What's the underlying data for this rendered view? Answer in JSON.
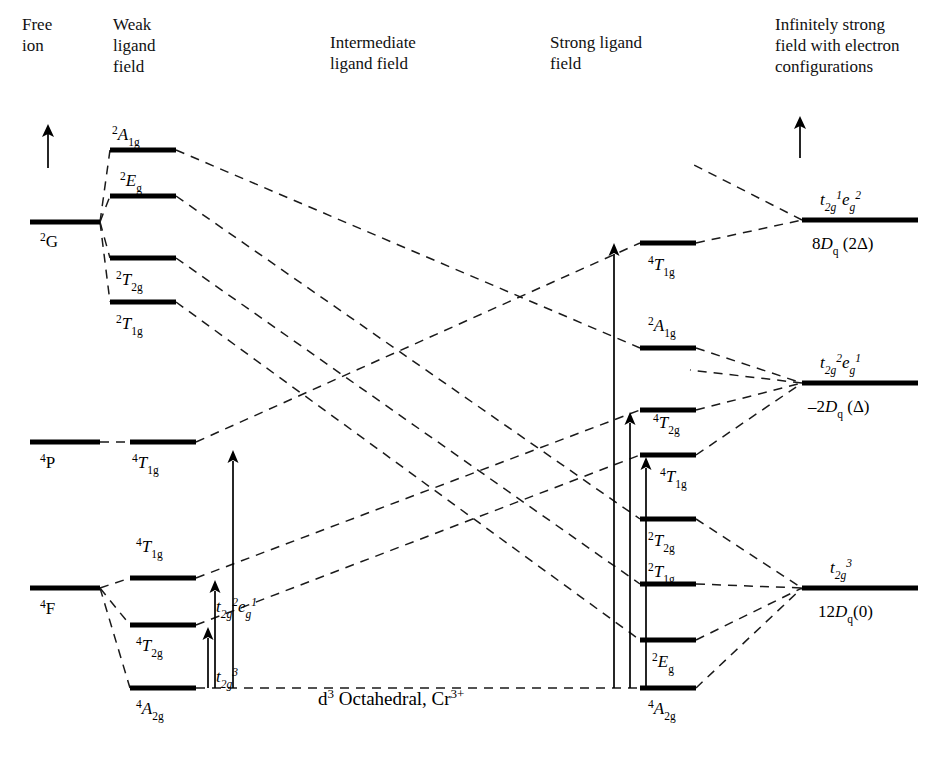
{
  "figure": {
    "caption": "d3 Octahedral, Cr3+",
    "caption_parts": {
      "d": "d",
      "d_sup": "3",
      "text": " Octahedral, Cr",
      "cr_sup": "3+"
    }
  },
  "columns": [
    {
      "id": "free-ion",
      "heading": "Free\nion",
      "heading_lines": [
        "Free",
        "ion"
      ]
    },
    {
      "id": "weak-field",
      "heading": "Weak ligand field",
      "heading_lines": [
        "Weak",
        "ligand",
        "field"
      ]
    },
    {
      "id": "intermediate-field",
      "heading": "Intermediate ligand field",
      "heading_lines": [
        "Intermediate",
        "ligand field"
      ]
    },
    {
      "id": "strong-field",
      "heading": "Strong ligand field",
      "heading_lines": [
        "Strong ligand",
        "field"
      ]
    },
    {
      "id": "infinite-field",
      "heading": "Infinitely strong field with electron configurations",
      "heading_lines": [
        "Infinitely strong",
        "field with electron",
        "configurations"
      ]
    }
  ],
  "axis": {
    "label": "energy-increasing-arrow",
    "direction": "up"
  },
  "free_ion_levels": [
    {
      "name": "2G",
      "sup": "2",
      "term": "G",
      "sub": "",
      "x1": 30,
      "x2": 100,
      "y": 222,
      "label_x": 40,
      "label_y": 247
    },
    {
      "name": "4P",
      "sup": "4",
      "term": "P",
      "sub": "",
      "x1": 30,
      "x2": 100,
      "y": 442,
      "label_x": 40,
      "label_y": 468
    },
    {
      "name": "4F",
      "sup": "4",
      "term": "F",
      "sub": "",
      "x1": 30,
      "x2": 100,
      "y": 588,
      "label_x": 40,
      "label_y": 614
    }
  ],
  "weak_field_levels": [
    {
      "name": "2A1g",
      "sup": "2",
      "term": "A",
      "sub": "1g",
      "x1": 110,
      "x2": 176,
      "y": 150,
      "label_x": 112,
      "label_y": 140,
      "label_above": true
    },
    {
      "name": "2Eg",
      "sup": "2",
      "term": "E",
      "sub": "g",
      "x1": 110,
      "x2": 176,
      "y": 196,
      "label_x": 120,
      "label_y": 186,
      "label_above": true
    },
    {
      "name": "2T2g",
      "sup": "2",
      "term": "T",
      "sub": "2g",
      "x1": 110,
      "x2": 176,
      "y": 258,
      "label_x": 116,
      "label_y": 285,
      "label_above": false
    },
    {
      "name": "2T1g",
      "sup": "2",
      "term": "T",
      "sub": "1g",
      "x1": 110,
      "x2": 176,
      "y": 302,
      "label_x": 116,
      "label_y": 329,
      "label_above": false
    },
    {
      "name": "4T1g-P",
      "sup": "4",
      "term": "T",
      "sub": "1g",
      "x1": 130,
      "x2": 196,
      "y": 442,
      "label_x": 132,
      "label_y": 468,
      "label_above": false
    },
    {
      "name": "4T1g-F",
      "sup": "4",
      "term": "T",
      "sub": "1g",
      "x1": 130,
      "x2": 196,
      "y": 578,
      "label_x": 136,
      "label_y": 552,
      "label_above": true
    },
    {
      "name": "4T2g",
      "sup": "4",
      "term": "T",
      "sub": "2g",
      "x1": 130,
      "x2": 196,
      "y": 625,
      "label_x": 136,
      "label_y": 651,
      "label_above": false
    },
    {
      "name": "4A2g",
      "sup": "4",
      "term": "A",
      "sub": "2g",
      "x1": 130,
      "x2": 196,
      "y": 688,
      "label_x": 136,
      "label_y": 714,
      "label_above": false
    }
  ],
  "weak_field_configs": [
    {
      "name": "t2g2eg1",
      "x": 216,
      "y": 612,
      "parts": [
        {
          "t": "t",
          "i": true
        },
        {
          "t": "2g",
          "sub": true
        },
        {
          "t": "2",
          "sup": true
        },
        {
          "t": "e",
          "i": true
        },
        {
          "t": "g",
          "sub": true
        },
        {
          "t": "1",
          "sup": true
        }
      ]
    },
    {
      "name": "t2g3",
      "x": 216,
      "y": 682,
      "parts": [
        {
          "t": "t",
          "i": true
        },
        {
          "t": "2g",
          "sub": true
        },
        {
          "t": "3",
          "sup": true
        }
      ]
    }
  ],
  "strong_field_levels": [
    {
      "name": "4T1g-top",
      "sup": "4",
      "term": "T",
      "sub": "1g",
      "x1": 640,
      "x2": 696,
      "y": 243,
      "label_x": 648,
      "label_y": 270,
      "label_above": false
    },
    {
      "name": "2A1g",
      "sup": "2",
      "term": "A",
      "sub": "1g",
      "x1": 640,
      "x2": 696,
      "y": 348,
      "label_x": 648,
      "label_y": 331,
      "label_above": true
    },
    {
      "name": "4T2g",
      "sup": "4",
      "term": "T",
      "sub": "2g",
      "x1": 640,
      "x2": 696,
      "y": 410,
      "label_x": 653,
      "label_y": 428,
      "label_above": false
    },
    {
      "name": "4T1g-mid",
      "sup": "4",
      "term": "T",
      "sub": "1g",
      "x1": 640,
      "x2": 696,
      "y": 455,
      "label_x": 660,
      "label_y": 482,
      "label_above": false
    },
    {
      "name": "2T2g",
      "sup": "2",
      "term": "T",
      "sub": "2g",
      "x1": 640,
      "x2": 696,
      "y": 519,
      "label_x": 648,
      "label_y": 546,
      "label_above": false
    },
    {
      "name": "2T1g",
      "sup": "2",
      "term": "T",
      "sub": "1g",
      "x1": 640,
      "x2": 696,
      "y": 584,
      "label_x": 648,
      "label_y": 577,
      "label_above": true
    },
    {
      "name": "2Eg",
      "sup": "2",
      "term": "E",
      "sub": "g",
      "x1": 640,
      "x2": 696,
      "y": 640,
      "label_x": 652,
      "label_y": 667,
      "label_above": false
    },
    {
      "name": "4A2g",
      "sup": "4",
      "term": "A",
      "sub": "2g",
      "x1": 640,
      "x2": 696,
      "y": 688,
      "label_x": 648,
      "label_y": 714,
      "label_above": false
    }
  ],
  "infinite_field_levels": [
    {
      "name": "t2g1eg2",
      "x1": 802,
      "x2": 918,
      "y": 220,
      "config_x": 820,
      "config_y": 205,
      "config_parts": [
        {
          "t": "t",
          "i": true
        },
        {
          "t": "2g",
          "sub": true
        },
        {
          "t": "1",
          "sup": true
        },
        {
          "t": "e",
          "i": true
        },
        {
          "t": "g",
          "sub": true
        },
        {
          "t": "2",
          "sup": true
        }
      ],
      "energy": "8Dq (2Δ)",
      "energy_x": 812,
      "energy_y": 249,
      "energy_parts": [
        {
          "t": "8"
        },
        {
          "t": "D",
          "i": true
        },
        {
          "t": "q",
          "sub": true
        },
        {
          "t": " (2Δ)"
        }
      ]
    },
    {
      "name": "t2g2eg1",
      "x1": 802,
      "x2": 918,
      "y": 383,
      "config_x": 820,
      "config_y": 368,
      "config_parts": [
        {
          "t": "t",
          "i": true
        },
        {
          "t": "2g",
          "sub": true
        },
        {
          "t": "2",
          "sup": true
        },
        {
          "t": "e",
          "i": true
        },
        {
          "t": "g",
          "sub": true
        },
        {
          "t": "1",
          "sup": true
        }
      ],
      "energy": "–2Dq (Δ)",
      "energy_x": 808,
      "energy_y": 412,
      "energy_parts": [
        {
          "t": "–2"
        },
        {
          "t": "D",
          "i": true
        },
        {
          "t": "q",
          "sub": true
        },
        {
          "t": " (Δ)"
        }
      ]
    },
    {
      "name": "t2g3",
      "x1": 802,
      "x2": 918,
      "y": 588,
      "config_x": 830,
      "config_y": 573,
      "config_parts": [
        {
          "t": "t",
          "i": true
        },
        {
          "t": "2g",
          "sub": true
        },
        {
          "t": "3",
          "sup": true
        }
      ],
      "energy": "12Dq(0)",
      "energy_x": 818,
      "energy_y": 617,
      "energy_parts": [
        {
          "t": "12"
        },
        {
          "t": "D",
          "i": true
        },
        {
          "t": "q",
          "sub": true
        },
        {
          "t": "(0)"
        }
      ]
    }
  ],
  "transition_arrows": [
    {
      "name": "weak-arrow-tall",
      "x": 233,
      "y_bottom": 688,
      "y_top": 450
    },
    {
      "name": "weak-arrow-mid",
      "x": 215,
      "y_bottom": 688,
      "y_top": 580
    },
    {
      "name": "weak-arrow-short",
      "x": 208,
      "y_bottom": 688,
      "y_top": 627
    },
    {
      "name": "strong-arrow-tall",
      "x": 614,
      "y_bottom": 688,
      "y_top": 243
    },
    {
      "name": "strong-arrow-mid",
      "x": 630,
      "y_bottom": 688,
      "y_top": 412
    },
    {
      "name": "strong-arrow-short",
      "x": 646,
      "y_bottom": 688,
      "y_top": 457
    }
  ],
  "energy_axis_arrows": [
    {
      "name": "left-energy-arrow",
      "x": 48,
      "y_bottom": 168,
      "y_top": 124
    },
    {
      "name": "right-energy-arrow",
      "x": 800,
      "y_bottom": 158,
      "y_top": 116
    }
  ],
  "correlation_lines": [
    {
      "name": "2G-to-2A1g",
      "points": "100,222 110,150"
    },
    {
      "name": "2G-to-2Eg",
      "points": "100,222 110,196"
    },
    {
      "name": "2G-to-2T2g",
      "points": "100,222 110,258"
    },
    {
      "name": "2G-to-2T1g",
      "points": "100,222 110,302"
    },
    {
      "name": "4P-to-4T1g",
      "points": "100,442 130,442"
    },
    {
      "name": "4F-to-4T1g",
      "points": "100,588 130,578"
    },
    {
      "name": "4F-to-4T2g",
      "points": "100,588 130,625"
    },
    {
      "name": "4F-to-4A2g",
      "points": "100,588 130,688"
    },
    {
      "name": "weak-2A1g-to-strong-2A1g",
      "points": "176,150 640,348"
    },
    {
      "name": "weak-2Eg-to-strong-2T2g",
      "points": "176,196 640,519"
    },
    {
      "name": "weak-2T2g-to-strong-2T1g",
      "points": "176,258 640,584"
    },
    {
      "name": "weak-2T1g-to-strong-2Eg",
      "points": "176,302 640,640"
    },
    {
      "name": "weak-4T1gP-to-strong-4T1g-top",
      "points": "196,442 640,243"
    },
    {
      "name": "weak-4T1gF-to-strong-4T2g",
      "points": "196,578 640,410"
    },
    {
      "name": "weak-4T2g-to-strong-4T1g-mid",
      "points": "196,625 640,455"
    },
    {
      "name": "weak-4A2g-to-strong-4A2g",
      "points": "196,688 640,688"
    },
    {
      "name": "strong-4T1g-top-to-inf-t2g1eg2",
      "points": "696,243 802,220"
    },
    {
      "name": "inf-t2g1eg2-upper-branch",
      "points": "802,220 694,165"
    },
    {
      "name": "strong-2A1g-to-inf-t2g2eg1",
      "points": "696,348 802,383"
    },
    {
      "name": "inf-t2g2eg1-branch-a",
      "points": "802,383 690,370"
    },
    {
      "name": "strong-4T2g-to-inf-t2g2eg1",
      "points": "696,410 802,383"
    },
    {
      "name": "strong-4T1g-mid-to-inf-t2g2eg1",
      "points": "696,455 802,383"
    },
    {
      "name": "strong-2T2g-to-inf-t2g3",
      "points": "696,519 802,588"
    },
    {
      "name": "strong-2T1g-to-inf-t2g3",
      "points": "696,584 802,588"
    },
    {
      "name": "strong-2Eg-to-inf-t2g3",
      "points": "696,640 802,588"
    },
    {
      "name": "strong-4A2g-to-inf-t2g3",
      "points": "696,688 802,588"
    }
  ]
}
